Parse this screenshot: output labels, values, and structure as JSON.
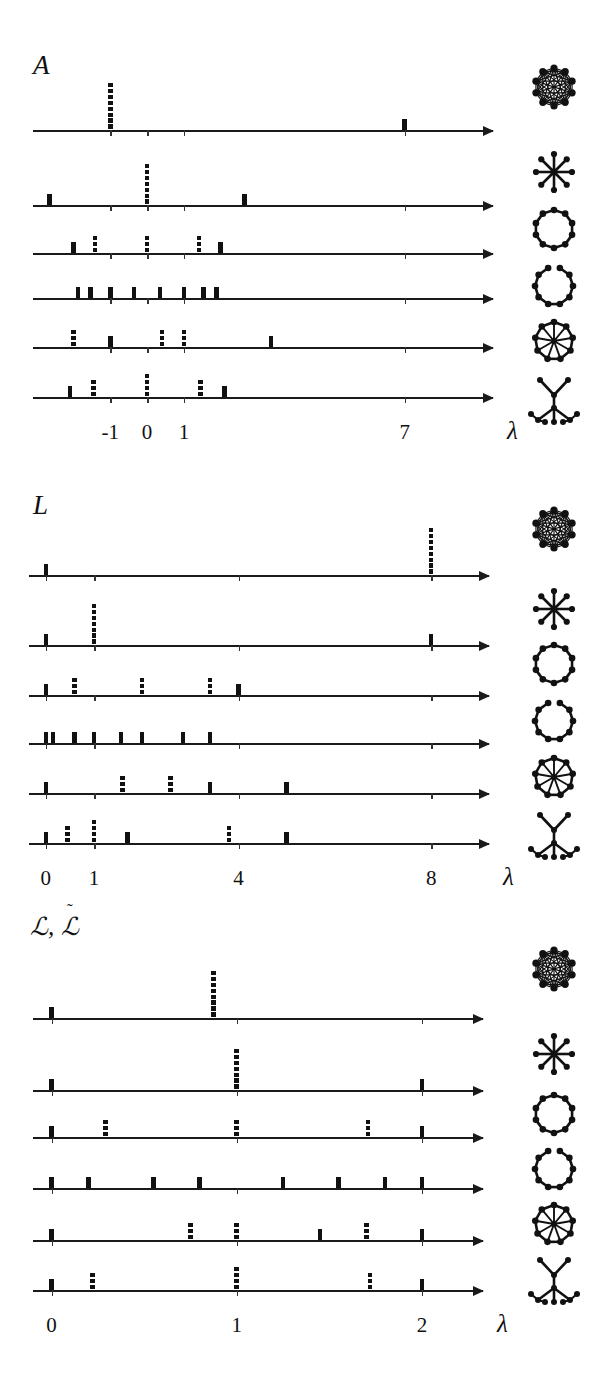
{
  "figure": {
    "caption_absent": true,
    "axis_variable": "λ",
    "n_rows": 6,
    "graphs": [
      {
        "key": "complete",
        "icon": "complete-graph-icon",
        "label": "complete graph"
      },
      {
        "key": "star",
        "icon": "star-graph-icon",
        "label": "star graph"
      },
      {
        "key": "cycle",
        "icon": "cycle-graph-icon",
        "label": "cycle graph"
      },
      {
        "key": "path",
        "icon": "path-graph-icon",
        "label": "path graph"
      },
      {
        "key": "wheel",
        "icon": "wheel-graph-icon",
        "label": "wheel graph"
      },
      {
        "key": "tree",
        "icon": "tree-graph-icon",
        "label": "tree graph"
      }
    ]
  },
  "panels": [
    {
      "id": "A",
      "label": "A",
      "label_kind": "plain-italic",
      "lambda_symbol": "λ",
      "axis": {
        "min": -3.1,
        "max": 9.4,
        "ticks": [
          -1,
          0,
          1,
          7
        ],
        "tick_labels": [
          "-1",
          "0",
          "1",
          "7"
        ]
      }
    },
    {
      "id": "L",
      "label": "L",
      "label_kind": "plain-italic",
      "lambda_symbol": "λ",
      "axis": {
        "min": -0.35,
        "max": 9.2,
        "ticks": [
          0,
          1,
          4,
          8
        ],
        "tick_labels": [
          "0",
          "1",
          "4",
          "8"
        ]
      }
    },
    {
      "id": "NL",
      "label": "ℒ, ℒ̃",
      "label_parts": {
        "first": "ℒ",
        "comma": ",",
        "second": "ℒ",
        "accent": "˜"
      },
      "label_kind": "script-with-tilde",
      "lambda_symbol": "λ",
      "axis": {
        "min": -0.1,
        "max": 2.33,
        "ticks": [
          0,
          1,
          2
        ],
        "tick_labels": [
          "0",
          "1",
          "2"
        ]
      }
    }
  ],
  "chart_data": {
    "type": "scatter",
    "xlabel": "λ",
    "ylabel": "multiplicity (bar height)",
    "panels": [
      {
        "operator": "A",
        "xlim": [
          -3.1,
          9.4
        ],
        "xticks": [
          -1,
          0,
          1,
          7
        ],
        "rows": [
          {
            "graph": "complete",
            "eigenvalues": [
              -1,
              7
            ],
            "multiplicities": [
              7,
              1
            ]
          },
          {
            "graph": "star",
            "eigenvalues": [
              -2.65,
              0,
              2.65
            ],
            "multiplicities": [
              1,
              6,
              1
            ]
          },
          {
            "graph": "cycle",
            "eigenvalues": [
              -2,
              -1.41,
              0,
              1.41,
              2
            ],
            "multiplicities": [
              1,
              2,
              2,
              2,
              1
            ]
          },
          {
            "graph": "path",
            "eigenvalues": [
              -1.88,
              -1.53,
              -1.0,
              -0.35,
              0.35,
              1.0,
              1.53,
              1.88
            ],
            "multiplicities": [
              1,
              1,
              1,
              1,
              1,
              1,
              1,
              1
            ]
          },
          {
            "graph": "wheel",
            "eigenvalues": [
              -2.0,
              -1.0,
              0.41,
              1.0,
              3.37
            ],
            "multiplicities": [
              2,
              1,
              2,
              2,
              1
            ]
          },
          {
            "graph": "tree",
            "eigenvalues": [
              -2.1,
              -1.45,
              0,
              1.45,
              2.1
            ],
            "multiplicities": [
              1,
              2,
              3,
              2,
              1
            ]
          }
        ]
      },
      {
        "operator": "L",
        "xlim": [
          -0.35,
          9.2
        ],
        "xticks": [
          0,
          1,
          4,
          8
        ],
        "rows": [
          {
            "graph": "complete",
            "eigenvalues": [
              0,
              8
            ],
            "multiplicities": [
              1,
              7
            ]
          },
          {
            "graph": "star",
            "eigenvalues": [
              0,
              1,
              8
            ],
            "multiplicities": [
              1,
              6,
              1
            ]
          },
          {
            "graph": "cycle",
            "eigenvalues": [
              0,
              0.59,
              2,
              3.41,
              4
            ],
            "multiplicities": [
              1,
              2,
              2,
              2,
              1
            ]
          },
          {
            "graph": "path",
            "eigenvalues": [
              0,
              0.15,
              0.59,
              1.0,
              1.56,
              2.0,
              2.85,
              3.41
            ],
            "multiplicities": [
              1,
              1,
              1,
              1,
              1,
              1,
              1,
              1
            ]
          },
          {
            "graph": "wheel",
            "eigenvalues": [
              0,
              1.59,
              2.59,
              3.41,
              5.0
            ],
            "multiplicities": [
              1,
              2,
              2,
              1,
              1
            ]
          },
          {
            "graph": "tree",
            "eigenvalues": [
              0,
              0.45,
              1.0,
              1.7,
              3.8,
              5.0
            ],
            "multiplicities": [
              1,
              2,
              3,
              1,
              2,
              1
            ]
          }
        ]
      },
      {
        "operator": "L-normalized",
        "xlim": [
          -0.1,
          2.33
        ],
        "xticks": [
          0,
          1,
          2
        ],
        "rows": [
          {
            "graph": "complete",
            "eigenvalues": [
              0,
              0.875
            ],
            "multiplicities": [
              1,
              7
            ]
          },
          {
            "graph": "star",
            "eigenvalues": [
              0,
              1.0,
              2.0
            ],
            "multiplicities": [
              1,
              6,
              1
            ]
          },
          {
            "graph": "cycle",
            "eigenvalues": [
              0,
              0.29,
              1.0,
              1.71,
              2.0
            ],
            "multiplicities": [
              1,
              2,
              2,
              2,
              1
            ]
          },
          {
            "graph": "path",
            "eigenvalues": [
              0,
              0.2,
              0.55,
              0.8,
              1.25,
              1.55,
              1.8,
              2.0
            ],
            "multiplicities": [
              1,
              1,
              1,
              1,
              1,
              1,
              1,
              1
            ]
          },
          {
            "graph": "wheel",
            "eigenvalues": [
              0,
              0.75,
              1.0,
              1.45,
              1.7,
              2.0
            ],
            "multiplicities": [
              1,
              2,
              2,
              1,
              2,
              1
            ]
          },
          {
            "graph": "tree",
            "eigenvalues": [
              0,
              0.22,
              1.0,
              1.72,
              2.0
            ],
            "multiplicities": [
              1,
              2,
              3,
              2,
              1
            ]
          }
        ]
      }
    ]
  }
}
